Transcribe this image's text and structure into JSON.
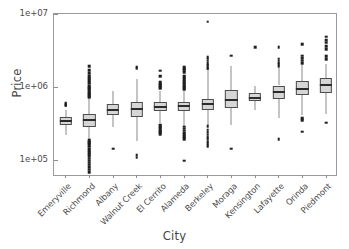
{
  "chart_data": {
    "type": "box",
    "title": "",
    "xlabel": "City",
    "ylabel": "Price",
    "yscale": "log",
    "ylim": [
      60000,
      10000000
    ],
    "ytick_labels": [
      "1e+07",
      "1e+06",
      "1e+05"
    ],
    "ytick_values": [
      10000000,
      1000000,
      100000
    ],
    "grid": false,
    "legend": null,
    "categories": [
      "Emeryville",
      "Richmond",
      "Albany",
      "Walnut Creek",
      "El Cerrito",
      "Alameda",
      "Berkeley",
      "Moraga",
      "Kensington",
      "Lafayette",
      "Orinda",
      "Piedmont"
    ],
    "boxes": [
      {
        "category": "Emeryville",
        "whisker_low": 225000,
        "q1": 305000,
        "median": 345000,
        "q3": 390000,
        "whisker_high": 490000,
        "outliers": [
          560000,
          575000,
          590000,
          610000
        ]
      },
      {
        "category": "Richmond",
        "whisker_low": 78000,
        "q1": 290000,
        "median": 360000,
        "q3": 430000,
        "whisker_high": 690000,
        "outliers": [
          1950000,
          1700000,
          1560000,
          1420000,
          1330000,
          1250000,
          1180000,
          1120000,
          1060000,
          1010000,
          965000,
          925000,
          880000,
          845000,
          810000,
          780000,
          750000,
          725000,
          70000,
          75000,
          82000,
          88000,
          94000,
          100000,
          107000,
          115000,
          122000,
          130000,
          138000,
          146000,
          155000,
          163000,
          172000,
          180000,
          190000
        ]
      },
      {
        "category": "Albany",
        "whisker_low": 290000,
        "q1": 425000,
        "median": 495000,
        "q3": 590000,
        "whisker_high": 880000,
        "outliers": [
          145000
        ]
      },
      {
        "category": "Walnut Creek",
        "whisker_low": 185000,
        "q1": 390000,
        "median": 500000,
        "q3": 640000,
        "whisker_high": 1280000,
        "outliers": [
          1900000,
          1820000,
          110000,
          118000
        ]
      },
      {
        "category": "El Cerrito",
        "whisker_low": 330000,
        "q1": 470000,
        "median": 545000,
        "q3": 625000,
        "whisker_high": 900000,
        "outliers": [
          1680000,
          1450000,
          1400000,
          1180000,
          1120000,
          1080000,
          1030000,
          990000,
          960000,
          310000,
          295000,
          282000,
          270000,
          258000,
          248000,
          240000,
          232000
        ]
      },
      {
        "category": "Alameda",
        "whisker_low": 300000,
        "q1": 480000,
        "median": 550000,
        "q3": 640000,
        "whisker_high": 900000,
        "outliers": [
          1870000,
          1790000,
          1710000,
          1620000,
          1450000,
          1370000,
          1300000,
          1220000,
          1160000,
          1100000,
          1050000,
          1005000,
          965000,
          930000,
          290000,
          272000,
          256000,
          240000,
          228000,
          216000,
          205000,
          196000,
          100000
        ]
      },
      {
        "category": "Berkeley",
        "whisker_low": 310000,
        "q1": 490000,
        "median": 590000,
        "q3": 700000,
        "whisker_high": 1720000,
        "outliers": [
          7900000,
          2600000,
          2450000,
          2300000,
          2150000,
          2030000,
          1930000,
          1840000,
          1790000,
          295000,
          265000,
          245000,
          225000,
          208000,
          195000,
          182000,
          172000,
          163000,
          155000
        ]
      },
      {
        "category": "Moraga",
        "whisker_low": 305000,
        "q1": 520000,
        "median": 670000,
        "q3": 910000,
        "whisker_high": 1960000,
        "outliers": [
          2700000,
          145000
        ]
      },
      {
        "category": "Kensington",
        "whisker_low": 490000,
        "q1": 660000,
        "median": 720000,
        "q3": 830000,
        "whisker_high": 1060000,
        "outliers": [
          3550000
        ]
      },
      {
        "category": "Lafayette",
        "whisker_low": 385000,
        "q1": 690000,
        "median": 860000,
        "q3": 1060000,
        "whisker_high": 1840000,
        "outliers": [
          3500000,
          2450000,
          2300000,
          2180000,
          2060000,
          1960000,
          195000
        ]
      },
      {
        "category": "Orinda",
        "whisker_low": 420000,
        "q1": 790000,
        "median": 960000,
        "q3": 1210000,
        "whisker_high": 2000000,
        "outliers": [
          3900000,
          2700000,
          2500000,
          2320000,
          2150000,
          380000,
          360000,
          250000
        ]
      },
      {
        "category": "Piedmont",
        "whisker_low": 435000,
        "q1": 850000,
        "median": 1080000,
        "q3": 1340000,
        "whisker_high": 2050000,
        "outliers": [
          4900000,
          4400000,
          4050000,
          3650000,
          3300000,
          2650000,
          2400000,
          330000
        ]
      }
    ]
  },
  "axes": {
    "ylabel": "Price",
    "xlabel": "City"
  },
  "style": {
    "box_fill": "#d6d6d6",
    "box_border": "#4d4d4d",
    "median_color": "#2b2b2b",
    "whisker_color": "#8a8a8a",
    "outlier_color": "#1f1f1f",
    "frame_color": "#9a9a9a",
    "text_color": "#4a4a4a"
  }
}
